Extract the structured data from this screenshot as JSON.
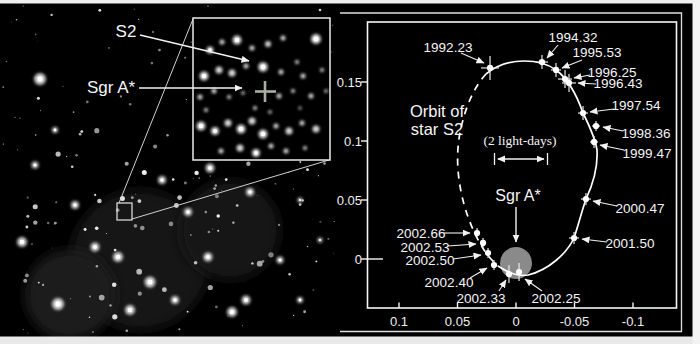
{
  "canvas": {
    "bg": "#000000",
    "margin_color": "#f0f0f0"
  },
  "left_panel": {
    "s2_label": "S2",
    "sgra_label": "Sgr A*"
  },
  "chart_data": {
    "type": "scatter",
    "annotations": {
      "orbit_label": [
        "Orbit of",
        "star S2"
      ],
      "scale_label": "(2 light-days)",
      "sgra_label": "Sgr A*"
    },
    "x_axis": {
      "tick_labels": [
        "0.1",
        "0.05",
        "0",
        "-0.05",
        "-0.1"
      ],
      "tick_values": [
        0.1,
        0.05,
        0,
        -0.05,
        -0.1
      ],
      "range": [
        0.127,
        -0.138
      ]
    },
    "y_axis": {
      "tick_labels": [
        "0.15",
        "0.1",
        "0.05",
        "0"
      ],
      "tick_values": [
        0.15,
        0.1,
        0.05,
        0
      ],
      "range": [
        -0.042,
        0.201
      ]
    },
    "grid": "off",
    "points": [
      {
        "label": "1992.23",
        "ra": 0.0222,
        "dec": 0.1619,
        "err_px": [
          9,
          12
        ],
        "label_px": [
          448,
          47
        ],
        "arrow": [
          [
            461,
            53
          ],
          [
            484,
            63
          ]
        ]
      },
      {
        "label": "1994.32",
        "ra": -0.0222,
        "dec": 0.1669,
        "err_px": [
          6,
          7
        ],
        "label_px": [
          573,
          37
        ],
        "arrow": [
          [
            558,
            45
          ],
          [
            547,
            58
          ]
        ]
      },
      {
        "label": "1995.53",
        "ra": -0.0342,
        "dec": 0.1602,
        "err_px": [
          5,
          7
        ],
        "label_px": [
          597,
          52
        ],
        "arrow": [
          [
            582,
            60
          ],
          [
            562,
            68
          ]
        ]
      },
      {
        "label": "1996.25",
        "ra": -0.0419,
        "dec": 0.1525,
        "err_px": [
          7,
          9
        ],
        "label_px": [
          612,
          72
        ],
        "arrow": [
          [
            590,
            75
          ],
          [
            574,
            78
          ]
        ]
      },
      {
        "label": "1996.43",
        "ra": -0.0453,
        "dec": 0.1492,
        "err_px": [
          7,
          9
        ],
        "label_px": [
          618,
          83
        ],
        "arrow": [
          [
            596,
            84
          ],
          [
            578,
            83
          ]
        ]
      },
      {
        "label": "1997.54",
        "ra": -0.0573,
        "dec": 0.1237,
        "err_px": [
          5,
          7
        ],
        "label_px": [
          636,
          105
        ],
        "arrow": [
          [
            614,
            109
          ],
          [
            590,
            112
          ]
        ]
      },
      {
        "label": "1998.36",
        "ra": -0.0684,
        "dec": 0.1127,
        "err_px": [
          4,
          5
        ],
        "label_px": [
          646,
          133
        ],
        "arrow": [
          [
            623,
            131
          ],
          [
            603,
            127
          ]
        ]
      },
      {
        "label": "1999.47",
        "ra": -0.0667,
        "dec": 0.0992,
        "err_px": [
          4,
          6
        ],
        "label_px": [
          647,
          153
        ],
        "arrow": [
          [
            624,
            150
          ],
          [
            600,
            145
          ]
        ]
      },
      {
        "label": "2000.47",
        "ra": -0.0598,
        "dec": 0.0508,
        "err_px": [
          5,
          6
        ],
        "label_px": [
          640,
          208
        ],
        "arrow": [
          [
            617,
            206
          ],
          [
            593,
            201
          ]
        ]
      },
      {
        "label": "2001.50",
        "ra": -0.0496,
        "dec": 0.0178,
        "err_px": [
          5,
          6
        ],
        "label_px": [
          630,
          243
        ],
        "arrow": [
          [
            607,
            242
          ],
          [
            582,
            239
          ]
        ]
      },
      {
        "label": "2002.25",
        "ra": -0.0026,
        "dec": -0.011,
        "err_px": [
          2,
          9
        ],
        "label_px": [
          556,
          298
        ],
        "arrow": [
          [
            542,
            291
          ],
          [
            525,
            279
          ]
        ]
      },
      {
        "label": "2002.33",
        "ra": 0.006,
        "dec": -0.0127,
        "err_px": [
          2,
          9
        ],
        "label_px": [
          481,
          298
        ],
        "arrow": [
          [
            499,
            291
          ],
          [
            506,
            280
          ]
        ]
      },
      {
        "label": "2002.40",
        "ra": 0.0188,
        "dec": -0.0051,
        "err_px": [
          3,
          5
        ],
        "label_px": [
          449,
          282
        ],
        "arrow": [
          [
            470,
            278
          ],
          [
            487,
            268
          ]
        ]
      },
      {
        "label": "2002.50",
        "ra": 0.0239,
        "dec": 0.0051,
        "err_px": [
          3,
          5
        ],
        "label_px": [
          430,
          260
        ],
        "arrow": [
          [
            453,
            259
          ],
          [
            481,
            255
          ]
        ]
      },
      {
        "label": "2002.53",
        "ra": 0.0282,
        "dec": 0.0136,
        "err_px": [
          3,
          5
        ],
        "label_px": [
          425,
          247
        ],
        "arrow": [
          [
            448,
            246
          ],
          [
            476,
            244
          ]
        ]
      },
      {
        "label": "2002.66",
        "ra": 0.0333,
        "dec": 0.022,
        "err_px": [
          3,
          5
        ],
        "label_px": [
          421,
          233
        ],
        "arrow": [
          [
            444,
            233
          ],
          [
            470,
            233
          ]
        ]
      }
    ],
    "sgr_a": {
      "ra": 0,
      "dec": -0.0034,
      "marker": "filled gray circle"
    },
    "layout": {
      "x0_px": 516,
      "y0_px": 259,
      "px_per_arcsec_x": 1170,
      "px_per_arcsec_y": 1180,
      "frame_px": [
        367.5,
        22,
        676.5,
        308
      ],
      "x_label_y": 321,
      "y_label_x": 362
    },
    "colors": {
      "background": "#000000",
      "points": "#ffffff",
      "orbit": "#ffffff",
      "sgra_circle": "#8a8a8a",
      "text": "#f5f5f5"
    }
  }
}
